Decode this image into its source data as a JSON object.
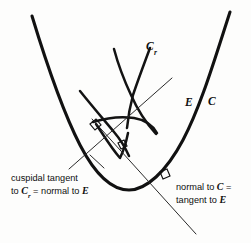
{
  "figure": {
    "kind": "geometry-diagram",
    "background_color": "#fdfdfc",
    "ink_color": "#111111",
    "width": 251,
    "height": 243,
    "curve_labels": {
      "parallel_curve": "C",
      "parallel_curve_subscript": "r",
      "evolute": "E",
      "base_curve": "C"
    },
    "annotations": {
      "left": {
        "line1": "cuspidal tangent",
        "line2_prefix": "to ",
        "line2_var1": "C",
        "line2_var1_sub": "r",
        "line2_middle": " = normal to ",
        "line2_var2": "E"
      },
      "right": {
        "line1_prefix": "normal to ",
        "line1_var": "C",
        "line1_suffix": " =",
        "line2_prefix": "tangent to ",
        "line2_var": "E"
      }
    },
    "markers": {
      "right_angle_upper": "right-angle-marker",
      "right_angle_lower": "right-angle-marker",
      "right_angle_on_parabola": "right-angle-marker"
    }
  }
}
